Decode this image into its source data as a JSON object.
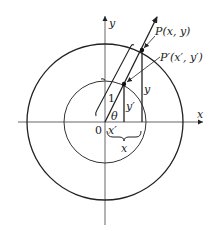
{
  "diagram": {
    "type": "unit-circle-projection",
    "origin_label": "0",
    "axes": {
      "x_label": "x",
      "y_label": "y"
    },
    "points": {
      "P": {
        "label": "P(x, y)"
      },
      "P_prime": {
        "label": "P′(x′, y′)"
      }
    },
    "segment_labels": {
      "unit_radius": "1",
      "angle": "θ",
      "y_prime": "y′",
      "y": "y",
      "x_prime": "x′",
      "x": "x"
    },
    "colors": {
      "stroke": "#222222",
      "background": "#ffffff"
    }
  }
}
